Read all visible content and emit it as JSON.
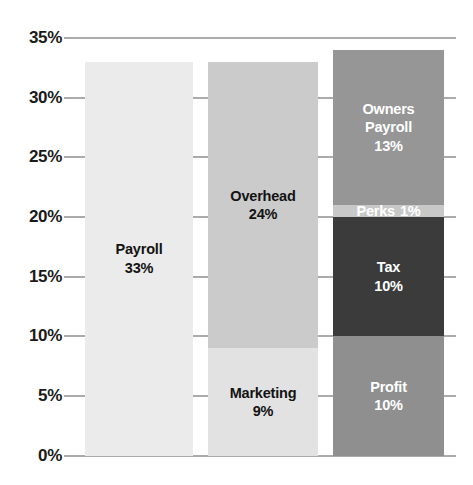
{
  "chart_data": {
    "type": "bar",
    "subtype": "stacked-column",
    "title": "",
    "subtitle": "",
    "xlabel": "",
    "ylabel": "",
    "ylim": [
      0,
      35
    ],
    "ytick_labels": [
      "0%",
      "5%",
      "10%",
      "15%",
      "20%",
      "25%",
      "30%",
      "35%"
    ],
    "ytick_values": [
      0,
      5,
      10,
      15,
      20,
      25,
      30,
      35
    ],
    "grid": true,
    "legend": "none",
    "categories": [
      "Payroll",
      "Marketing / Overhead",
      "Profit / Tax / Perks / Owners Payroll"
    ],
    "columns": [
      {
        "name": "column-1",
        "total": 33,
        "segments": [
          {
            "label": "Payroll",
            "value": 33,
            "value_label": "33%",
            "color": "#ebebeb",
            "text_color": "#131313"
          }
        ]
      },
      {
        "name": "column-2",
        "total": 33,
        "segments": [
          {
            "label": "Marketing",
            "value": 9,
            "value_label": "9%",
            "color": "#e2e2e2",
            "text_color": "#131313"
          },
          {
            "label": "Overhead",
            "value": 24,
            "value_label": "24%",
            "color": "#cbcbcb",
            "text_color": "#131313"
          }
        ]
      },
      {
        "name": "column-3",
        "total": 34,
        "segments": [
          {
            "label": "Profit",
            "value": 10,
            "value_label": "10%",
            "color": "#8f8f8f",
            "text_color": "#ffffff"
          },
          {
            "label": "Tax",
            "value": 10,
            "value_label": "10%",
            "color": "#3b3b3b",
            "text_color": "#ffffff"
          },
          {
            "label": "Perks",
            "value": 1,
            "value_label": "1%",
            "color": "#c8c8c8",
            "text_color": "#ffffff"
          },
          {
            "label": "Owners Payroll",
            "value": 13,
            "value_label": "13%",
            "color": "#969696",
            "text_color": "#ffffff"
          }
        ]
      }
    ],
    "series": [
      {
        "name": "Payroll",
        "values": [
          33,
          0,
          0
        ]
      },
      {
        "name": "Marketing",
        "values": [
          0,
          9,
          0
        ]
      },
      {
        "name": "Overhead",
        "values": [
          0,
          24,
          0
        ]
      },
      {
        "name": "Profit",
        "values": [
          0,
          0,
          10
        ]
      },
      {
        "name": "Tax",
        "values": [
          0,
          0,
          10
        ]
      },
      {
        "name": "Perks",
        "values": [
          0,
          0,
          1
        ]
      },
      {
        "name": "Owners Payroll",
        "values": [
          0,
          0,
          13
        ]
      }
    ],
    "axis_color": "#58585a"
  }
}
